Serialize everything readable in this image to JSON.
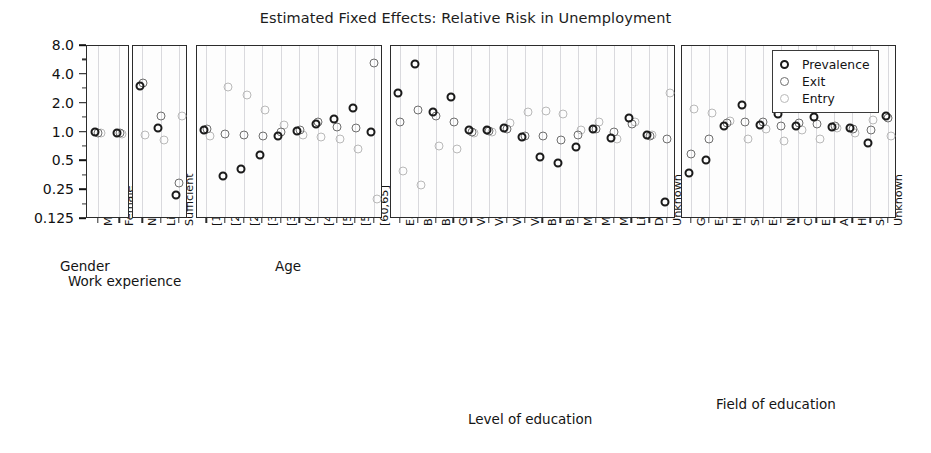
{
  "chart_data": {
    "type": "scatter",
    "title": "Estimated Fixed Effects: Relative Risk in Unemployment",
    "ylabel": "",
    "xlabel": "",
    "yscale": "log2",
    "ylim": [
      0.125,
      8.0
    ],
    "ytick_labels": [
      "8.0",
      "4.0",
      "2.0",
      "1.0",
      "0.5",
      "0.25",
      "0.125"
    ],
    "ytick_values": [
      8.0,
      4.0,
      2.0,
      1.0,
      0.5,
      0.25,
      0.125
    ],
    "grid": "vertical",
    "legend": {
      "position": "top-right",
      "entries": [
        {
          "name": "Prevalence",
          "style": "dark-open-circle"
        },
        {
          "name": "Exit",
          "style": "mid-open-circle"
        },
        {
          "name": "Entry",
          "style": "light-open-circle"
        }
      ]
    },
    "series": [
      "Prevalence",
      "Exit",
      "Entry"
    ],
    "panels": [
      {
        "group_label": "Gender",
        "categories": [
          "Male",
          "Female"
        ],
        "values": {
          "Prevalence": [
            1.02,
            1.0
          ],
          "Exit": [
            1.0,
            1.0
          ],
          "Entry": [
            0.98,
            0.97
          ]
        }
      },
      {
        "group_label": "Work experience",
        "categories": [
          "None",
          "Little",
          "Sufficient"
        ],
        "values": {
          "Prevalence": [
            3.05,
            1.12,
            0.22
          ],
          "Exit": [
            3.25,
            1.5,
            0.3
          ],
          "Entry": [
            0.95,
            0.83,
            1.5
          ]
        }
      },
      {
        "group_label": "Age",
        "categories": [
          "[18,20)",
          "[20,25)",
          "[25,30)",
          "[30,35)",
          "[35,40)",
          "[40,45)",
          "[45,50)",
          "[50,55)",
          "[55,60)",
          "[60,65]"
        ],
        "values": {
          "Prevalence": [
            1.05,
            0.35,
            0.42,
            0.58,
            0.92,
            1.03,
            1.22,
            1.38,
            1.82,
            1.02
          ],
          "Exit": [
            1.1,
            0.97,
            0.95,
            0.93,
            1.02,
            1.05,
            1.28,
            1.15,
            1.12,
            5.3
          ],
          "Entry": [
            0.93,
            3.0,
            2.45,
            1.72,
            1.2,
            0.95,
            0.9,
            0.86,
            0.68,
            0.2
          ]
        }
      },
      {
        "group_label": "Level of education",
        "categories": [
          "Early education",
          "Basic Education 1-6",
          "Basic Education 7-9",
          "Gymnasium",
          "Vocational Basic",
          "Vocational",
          "Vocational (deprecated)",
          "Vocational higher",
          "Bachelors (Applied Sciences)",
          "Bachelors (University)",
          "Masters (Applied Sciences)",
          "Masters (University)",
          "Medical Specialization",
          "Licensiate",
          "Doctorate (University)",
          "Unknown"
        ],
        "values": {
          "Prevalence": [
            2.6,
            5.2,
            1.65,
            2.35,
            1.05,
            1.05,
            1.12,
            0.9,
            0.55,
            0.48,
            0.7,
            1.08,
            0.88,
            1.42,
            0.95,
            0.19
          ],
          "Exit": [
            1.3,
            1.72,
            1.5,
            1.3,
            1.02,
            1.03,
            1.1,
            0.93,
            0.93,
            0.83,
            0.95,
            1.08,
            1.02,
            1.22,
            0.92,
            0.85
          ],
          "Entry": [
            0.4,
            0.28,
            0.72,
            0.68,
            1.0,
            1.02,
            1.25,
            1.65,
            1.68,
            1.55,
            1.05,
            1.28,
            0.86,
            1.3,
            0.95,
            2.6
          ]
        }
      },
      {
        "group_label": "Field of education",
        "categories": [
          "General Education",
          "Education",
          "Humanities and Arts",
          "Social Studies",
          "Economics and Law",
          "Natural Sciences",
          "Computer Science and IT",
          "Engineering",
          "Agriculture and Forestry",
          "Health and Welfare",
          "Services",
          "Unknown"
        ],
        "values": {
          "Prevalence": [
            0.38,
            0.52,
            1.18,
            1.92,
            1.2,
            1.55,
            1.18,
            1.45,
            1.15,
            1.12,
            0.78,
            1.5
          ],
          "Exit": [
            0.6,
            0.85,
            1.25,
            1.3,
            1.28,
            1.18,
            1.25,
            1.22,
            1.18,
            1.08,
            1.05,
            1.42
          ],
          "Entry": [
            1.75,
            1.6,
            1.32,
            0.85,
            1.1,
            0.82,
            1.05,
            0.85,
            1.12,
            1.0,
            1.35,
            0.92
          ]
        }
      }
    ]
  }
}
